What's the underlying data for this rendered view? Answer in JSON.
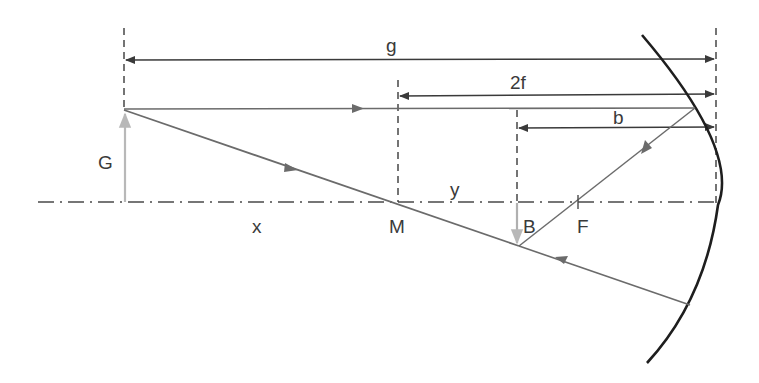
{
  "diagram": {
    "labels": {
      "g": "g",
      "two_f": "2f",
      "b": "b",
      "G": "G",
      "y": "y",
      "x": "x",
      "M": "M",
      "B": "B",
      "F": "F"
    },
    "colors": {
      "ray": "#6b6b6b",
      "dimension": "#3a3a3a",
      "mirror": "#1e1e1e",
      "object_arrow": "#b8b8b8",
      "image_arrow": "#b0b0b0",
      "axis": "#4a4a4a",
      "background": "#ffffff"
    },
    "elements": {
      "optical_axis": "dash-dot optical axis",
      "mirror": "concave mirror",
      "object": "object arrow G",
      "image": "inverted image arrow B",
      "center_point": "M",
      "focal_point": "F",
      "dimensions": [
        "g",
        "2f",
        "b"
      ],
      "rays": [
        "parallel ray",
        "focal reflected ray",
        "center ray",
        "reflected center ray"
      ]
    }
  }
}
